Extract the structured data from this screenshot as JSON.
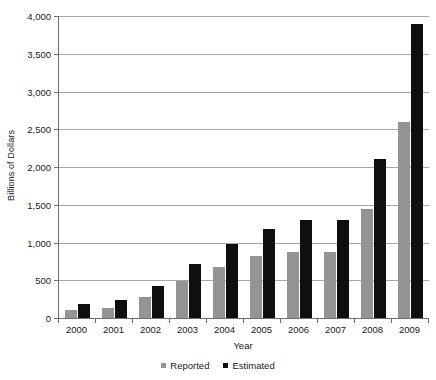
{
  "chart_data": {
    "type": "bar",
    "title": "",
    "xlabel": "Year",
    "ylabel": "Billions of Dollars",
    "categories": [
      "2000",
      "2001",
      "2002",
      "2003",
      "2004",
      "2005",
      "2006",
      "2007",
      "2008",
      "2009"
    ],
    "series": [
      {
        "name": "Reported",
        "color": "#949494",
        "values": [
          110,
          130,
          280,
          490,
          670,
          820,
          880,
          880,
          1450,
          2600
        ]
      },
      {
        "name": "Estimated",
        "color": "#0f0f0f",
        "values": [
          190,
          240,
          420,
          710,
          980,
          1180,
          1300,
          1300,
          2100,
          3900
        ]
      }
    ],
    "ylim": [
      0,
      4000
    ],
    "y_ticks": [
      0,
      500,
      1000,
      1500,
      2000,
      2500,
      3000,
      3500,
      4000
    ],
    "y_tick_labels": [
      "0",
      "500",
      "1,000",
      "1,500",
      "2,000",
      "2,500",
      "3,000",
      "3,500",
      "4,000"
    ],
    "grid": true,
    "legend_position": "bottom-center"
  },
  "axes": {
    "y_title": "Billions of Dollars",
    "x_title": "Year"
  },
  "legend": {
    "items": [
      {
        "label": "Reported",
        "color": "#949494"
      },
      {
        "label": "Estimated",
        "color": "#0f0f0f"
      }
    ]
  }
}
